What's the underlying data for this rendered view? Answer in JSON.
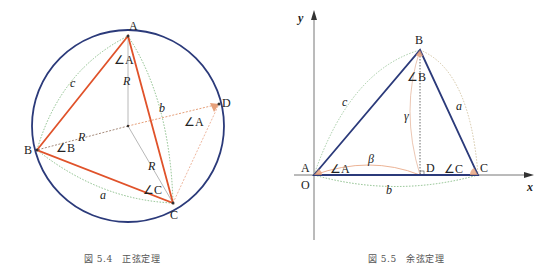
{
  "figures": [
    {
      "caption": "図 5.4　正弦定理",
      "labels": {
        "A": "A",
        "B": "B",
        "C": "C",
        "D": "D",
        "angleA": "∠A",
        "angleB": "∠B",
        "angleC": "∠C",
        "angleA2": "∠A",
        "a": "a",
        "b": "b",
        "c": "c",
        "R1": "R",
        "R2": "R",
        "R3": "R"
      }
    },
    {
      "caption": "図 5.5　余弦定理",
      "labels": {
        "A": "A",
        "B": "B",
        "C": "C",
        "D": "D",
        "O": "O",
        "x": "x",
        "y": "y",
        "angleA": "∠A",
        "angleB": "∠B",
        "angleC": "∠C",
        "a": "a",
        "b": "b",
        "c": "c",
        "beta": "β",
        "gamma": "γ"
      }
    }
  ],
  "colors": {
    "circle": "#2b3a7a",
    "triangle_sine": "#e0522a",
    "triangle_cosine": "#2b3a7a",
    "arc_green": "#6fae6f",
    "arc_orange": "#e6a07a",
    "radius": "#a0a0a0"
  }
}
